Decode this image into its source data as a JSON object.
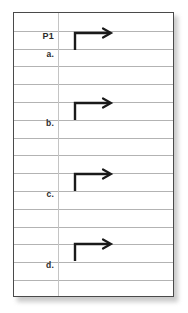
{
  "page": {
    "kind": "ruled-notebook-sheet",
    "background_color": "#ffffff",
    "frame_color": "#4a4a4a",
    "rule_color": "#b3b3b3",
    "margin_line_color": "#c4c4c4",
    "ink_color": "#1a1a1a",
    "rule_count": 16,
    "rule_spacing_px": 17.8,
    "margin_line_x_px": 44
  },
  "labels": [
    {
      "id": "heading",
      "text": "P1",
      "top_px": 18,
      "is_heading": true
    },
    {
      "id": "item-a",
      "text": "a.",
      "top_px": 36,
      "is_heading": false
    },
    {
      "id": "item-b",
      "text": "b.",
      "top_px": 105,
      "is_heading": false
    },
    {
      "id": "item-c",
      "text": "c.",
      "top_px": 176,
      "is_heading": false
    },
    {
      "id": "item-d",
      "text": "d.",
      "top_px": 247,
      "is_heading": false
    }
  ],
  "arrows": [
    {
      "id": "arrow-a",
      "label_ref": "item-a",
      "top_px": 14,
      "shape": "elbow-up-right-arrow"
    },
    {
      "id": "arrow-b",
      "label_ref": "item-b",
      "top_px": 84,
      "shape": "elbow-up-right-arrow"
    },
    {
      "id": "arrow-c",
      "label_ref": "item-c",
      "top_px": 155,
      "shape": "elbow-up-right-arrow"
    },
    {
      "id": "arrow-d",
      "label_ref": "item-d",
      "top_px": 225,
      "shape": "elbow-up-right-arrow"
    }
  ],
  "icons": {
    "elbow_arrow_name": "elbow-up-right-arrow-icon"
  }
}
